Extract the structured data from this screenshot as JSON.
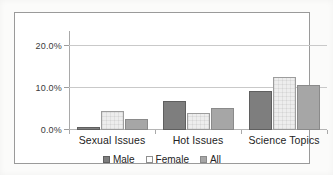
{
  "chart_data": {
    "type": "bar",
    "title": "",
    "subtitle": "",
    "xlabel": "",
    "ylabel": "",
    "categories": [
      "Sexual Issues",
      "Hot Issues",
      "Science Topics"
    ],
    "series": [
      {
        "name": "Male",
        "color": "#7e7e7e",
        "values": [
          0.8,
          6.8,
          9.2
        ]
      },
      {
        "name": "Female",
        "color": "#ededed",
        "values": [
          4.5,
          4.0,
          12.5
        ]
      },
      {
        "name": "All",
        "color": "#a6a6a6",
        "values": [
          2.5,
          5.3,
          10.7
        ]
      }
    ],
    "ylim": [
      0,
      22.5
    ],
    "yticks": [
      0,
      10,
      20
    ],
    "ytick_labels": [
      "0.0%",
      "10.0%",
      "20.0%"
    ],
    "grid": true,
    "grid_axis": "y",
    "legend_position": "bottom",
    "annotations": []
  },
  "axis": {
    "y_labels": [
      "20.0%",
      "10.0%",
      "0.0%"
    ]
  },
  "legend": {
    "items": [
      {
        "label": "Male"
      },
      {
        "label": "Female"
      },
      {
        "label": "All"
      }
    ]
  }
}
